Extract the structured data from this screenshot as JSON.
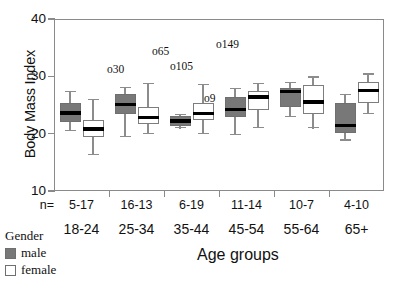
{
  "chart_data": {
    "type": "boxplot",
    "title": "",
    "xlabel": "Age groups",
    "ylabel": "Body Mass Index",
    "ylim": [
      10,
      40
    ],
    "yticks": [
      10,
      20,
      30,
      40
    ],
    "ytick_labels": [
      "10",
      "20",
      "30",
      "40"
    ],
    "grid": false,
    "legend_position": "bottom-left",
    "legend_title": "Gender",
    "categories": [
      "18-24",
      "25-34",
      "35-44",
      "45-54",
      "55-64",
      "65+"
    ],
    "n_row_header": "n=",
    "n_values": [
      "5-17",
      "16-13",
      "6-19",
      "11-14",
      "10-7",
      "4-10"
    ],
    "series": [
      {
        "name": "male",
        "fill": "#787878",
        "boxes": [
          {
            "category": "18-24",
            "whisker_low": 20.4,
            "q1": 22.1,
            "median": 23.6,
            "q3": 25.4,
            "whisker_high": 27.4
          },
          {
            "category": "25-34",
            "whisker_low": 19.4,
            "q1": 23.4,
            "median": 25.1,
            "q3": 26.9,
            "whisker_high": 28.2
          },
          {
            "category": "35-44",
            "whisker_low": 20.9,
            "q1": 21.4,
            "median": 22.2,
            "q3": 23.1,
            "whisker_high": 23.4
          },
          {
            "category": "45-54",
            "whisker_low": 19.8,
            "q1": 22.9,
            "median": 24.2,
            "q3": 26.4,
            "whisker_high": 28.0
          },
          {
            "category": "55-64",
            "whisker_low": 22.9,
            "q1": 24.6,
            "median": 27.4,
            "q3": 28.0,
            "whisker_high": 29.0
          },
          {
            "category": "65+",
            "whisker_low": 18.8,
            "q1": 20.2,
            "median": 21.4,
            "q3": 25.4,
            "whisker_high": 27.0
          }
        ]
      },
      {
        "name": "female",
        "fill": "#ffffff",
        "boxes": [
          {
            "category": "18-24",
            "whisker_low": 16.2,
            "q1": 19.5,
            "median": 20.8,
            "q3": 22.4,
            "whisker_high": 26.0
          },
          {
            "category": "25-34",
            "whisker_low": 19.9,
            "q1": 21.6,
            "median": 22.8,
            "q3": 24.7,
            "whisker_high": 28.8
          },
          {
            "category": "35-44",
            "whisker_low": 19.9,
            "q1": 22.4,
            "median": 23.5,
            "q3": 25.4,
            "whisker_high": 28.7
          },
          {
            "category": "45-54",
            "whisker_low": 20.9,
            "q1": 24.2,
            "median": 26.4,
            "q3": 27.5,
            "whisker_high": 28.9
          },
          {
            "category": "55-64",
            "whisker_low": 20.9,
            "q1": 23.5,
            "median": 25.5,
            "q3": 28.5,
            "whisker_high": 30.0
          },
          {
            "category": "65+",
            "whisker_low": 23.4,
            "q1": 25.4,
            "median": 27.5,
            "q3": 29.0,
            "whisker_high": 30.5
          }
        ]
      }
    ],
    "outlier_labels": [
      {
        "label": "o30",
        "x_px": 107,
        "y_px": 63
      },
      {
        "label": "o65",
        "x_px": 152,
        "y_px": 45
      },
      {
        "label": "o105",
        "x_px": 170,
        "y_px": 60
      },
      {
        "label": "o149",
        "x_px": 216,
        "y_px": 38
      },
      {
        "label": "o9",
        "x_px": 204,
        "y_px": 92
      }
    ]
  },
  "legend": {
    "title": "Gender",
    "items": [
      {
        "label": "male",
        "swatch": "male"
      },
      {
        "label": "female",
        "swatch": "female"
      }
    ]
  },
  "axes": {
    "y_title": "Body Mass Index",
    "x_title": "Age groups"
  }
}
